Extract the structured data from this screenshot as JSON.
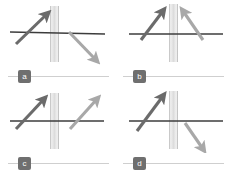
{
  "figure": {
    "layout": "2x2 grid",
    "panel_count": 4,
    "colors": {
      "background": "#ffffff",
      "axis_line": "#3c3c3c",
      "arrow_dark": "#6b6b6b",
      "arrow_light": "#a8a8a8",
      "slab_light": "#e9e9e9",
      "slab_edge": "#b4b4b4",
      "badge_background": "#6f6f6f",
      "badge_text": "#ffffff",
      "caption_rule": "#cfcfcf"
    },
    "panels": [
      {
        "id": "panel-a",
        "label": "a",
        "axis_label": "horizontal-interface-line",
        "slab_label": "vertical-slab",
        "incoming_ray": {
          "name": "incoming-ray",
          "shade": "dark",
          "direction": "up-right",
          "x1": 16,
          "y1": 44,
          "x2": 47,
          "y2": 14
        },
        "outgoing_ray": {
          "name": "outgoing-ray",
          "shade": "light",
          "direction": "down-right",
          "x1": 69,
          "y1": 32,
          "x2": 96,
          "y2": 60
        }
      },
      {
        "id": "panel-b",
        "label": "b",
        "axis_label": "horizontal-interface-line",
        "slab_label": "vertical-slab",
        "incoming_ray": {
          "name": "incoming-ray",
          "shade": "dark",
          "direction": "up-right",
          "x1": 26,
          "y1": 40,
          "x2": 48,
          "y2": 11
        },
        "outgoing_ray": {
          "name": "outgoing-ray",
          "shade": "light",
          "direction": "up-left",
          "x1": 88,
          "y1": 40,
          "x2": 68,
          "y2": 11
        }
      },
      {
        "id": "panel-c",
        "label": "c",
        "axis_label": "horizontal-interface-line",
        "slab_label": "vertical-slab",
        "incoming_ray": {
          "name": "incoming-ray",
          "shade": "dark",
          "direction": "up-right",
          "x1": 16,
          "y1": 42,
          "x2": 44,
          "y2": 12
        },
        "outgoing_ray": {
          "name": "outgoing-ray",
          "shade": "light",
          "direction": "up-right",
          "x1": 70,
          "y1": 42,
          "x2": 97,
          "y2": 12
        }
      },
      {
        "id": "panel-d",
        "label": "d",
        "axis_label": "horizontal-interface-line",
        "slab_label": "vertical-slab",
        "incoming_ray": {
          "name": "incoming-ray",
          "shade": "dark",
          "direction": "up-right-steep",
          "x1": 22,
          "y1": 44,
          "x2": 48,
          "y2": 9
        },
        "outgoing_ray": {
          "name": "outgoing-ray",
          "shade": "light",
          "direction": "down-right",
          "x1": 70,
          "y1": 36,
          "x2": 88,
          "y2": 62
        }
      }
    ]
  }
}
